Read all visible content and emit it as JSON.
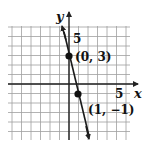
{
  "chart_data": {
    "type": "line",
    "title": "",
    "xlabel": "x",
    "ylabel": "y",
    "xlim": [
      -6,
      6
    ],
    "ylim": [
      -6,
      6
    ],
    "grid": true,
    "x_tick_labels": [
      "5"
    ],
    "y_tick_labels": [
      "5"
    ],
    "series": [
      {
        "name": "line",
        "equation": "y = -4x + 3",
        "x": [
          0,
          1
        ],
        "y": [
          3,
          -1
        ]
      }
    ],
    "points": [
      {
        "x": 0,
        "y": 3,
        "label": "(0, 3)"
      },
      {
        "x": 1,
        "y": -1,
        "label": "(1, −1)"
      }
    ],
    "colors": {
      "line": "#1a1a1a",
      "grid": "#9a9a9a",
      "axis": "#222222"
    }
  },
  "labels": {
    "x_axis": "x",
    "y_axis": "y",
    "x_tick": "5",
    "y_tick": "5",
    "point_a": "(0, 3)",
    "point_b": "(1, −1)"
  }
}
